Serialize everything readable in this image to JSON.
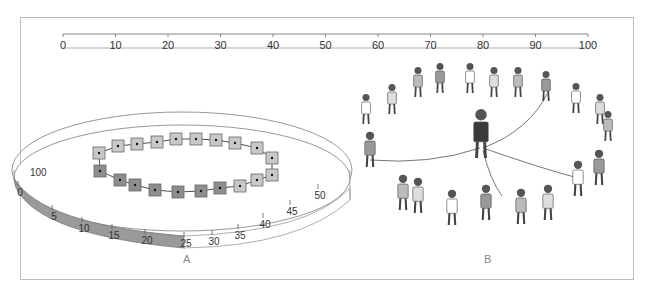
{
  "figure": {
    "number_line": {
      "min": 0,
      "max": 100,
      "ticks": [
        "0",
        "10",
        "20",
        "30",
        "40",
        "50",
        "60",
        "70",
        "80",
        "90",
        "100"
      ]
    },
    "panel_a": {
      "label": "A",
      "ring": {
        "outer_label": "100",
        "inner_ticks": [
          "0",
          "5",
          "10",
          "15",
          "20",
          "25",
          "30",
          "35",
          "40",
          "45",
          "50"
        ],
        "shaded_range": [
          0,
          25
        ],
        "shade_color": "#9a9a9a"
      },
      "chain": {
        "node_count": 21,
        "dark_nodes": 7,
        "light_color": "#c8c8c8",
        "dark_color": "#8e8e8e"
      }
    },
    "panel_b": {
      "label": "B",
      "description": "Illustration of children standing in a circle holding ropes to a central adult"
    }
  }
}
